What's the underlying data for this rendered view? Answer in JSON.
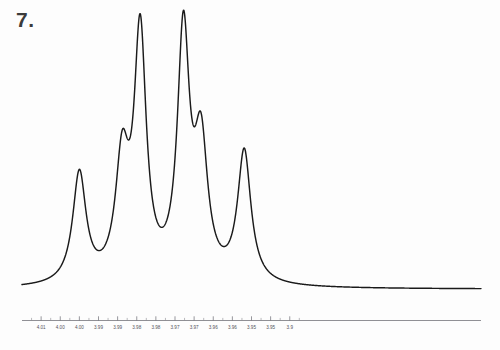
{
  "figure": {
    "number_label": "7.",
    "background_color": "#fdfdfd",
    "trace_color": "#1a1a1a",
    "axis_color": "#6b6b72"
  },
  "chart_data": {
    "type": "line",
    "title": "",
    "subtitle": "",
    "xlabel": "",
    "ylabel": "",
    "grid": false,
    "legend": "none",
    "axis_direction": "reversed",
    "xlim": [
      4.015,
      3.895
    ],
    "ylim": [
      0,
      1
    ],
    "tick_labels": [
      "4.01",
      "4.00",
      "4.00",
      "3.99",
      "3.99",
      "3.98",
      "3.98",
      "3.97",
      "3.97",
      "3.96",
      "3.96",
      "3.95",
      "3.95",
      "3.9"
    ],
    "tick_values": [
      4.01,
      4.005,
      4.0,
      3.995,
      3.99,
      3.985,
      3.98,
      3.975,
      3.97,
      3.965,
      3.96,
      3.955,
      3.95,
      3.945
    ],
    "minor_tick_values": [
      4.0125,
      4.0075,
      4.0025,
      3.9975,
      3.9925,
      3.9875,
      3.9825,
      3.9775,
      3.9725,
      3.9675,
      3.9625,
      3.9575,
      3.9525,
      3.9475,
      3.9425
    ],
    "baseline": 0.02,
    "peaks": [
      {
        "index": 1,
        "center_ppm": 4.0,
        "height": 0.42,
        "width_ppm": 0.0021
      },
      {
        "index": 2,
        "center_ppm": 3.9888,
        "height": 0.44,
        "width_ppm": 0.0021
      },
      {
        "index": 3,
        "center_ppm": 3.9841,
        "height": 0.93,
        "width_ppm": 0.0019
      },
      {
        "index": 4,
        "center_ppm": 3.9728,
        "height": 0.93,
        "width_ppm": 0.0019
      },
      {
        "index": 5,
        "center_ppm": 3.9682,
        "height": 0.5,
        "width_ppm": 0.0021
      },
      {
        "index": 6,
        "center_ppm": 3.9569,
        "height": 0.5,
        "width_ppm": 0.0021
      }
    ],
    "series": [
      {
        "name": "spectrum",
        "description": "NMR multiplet trace, six resolved lines"
      }
    ]
  }
}
